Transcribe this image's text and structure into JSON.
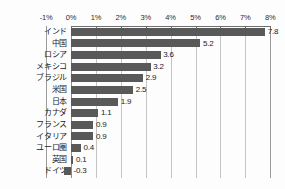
{
  "chart_data": {
    "type": "bar",
    "orientation": "horizontal",
    "title": "",
    "subtitle": "",
    "xlabel": "",
    "ylabel": "",
    "xlim": [
      -1,
      8
    ],
    "x_tick_labels": [
      "-1%",
      "0%",
      "1%",
      "2%",
      "3%",
      "4%",
      "5%",
      "6%",
      "7%",
      "8%"
    ],
    "x_ticks": [
      -1,
      0,
      1,
      2,
      3,
      4,
      5,
      6,
      7,
      8
    ],
    "grid": true,
    "legend": "none",
    "value_suffix": "",
    "categories": [
      "インド",
      "中国",
      "ロシア",
      "メキシコ",
      "ブラジル",
      "米国",
      "日本",
      "カナダ",
      "フランス",
      "イタリア",
      "ユーロ圏",
      "英国",
      "ドイツ"
    ],
    "values": [
      7.8,
      5.2,
      3.6,
      3.2,
      2.9,
      2.5,
      1.9,
      1.1,
      0.9,
      0.9,
      0.4,
      0.1,
      -0.3
    ],
    "data_labels": [
      "7.8",
      "5.2",
      "3.6",
      "3.2",
      "2.9",
      "2.5",
      "1.9",
      "1.1",
      "0.9",
      "0.9",
      "0.4",
      "0.1",
      "-0.3"
    ],
    "colors": {
      "bar": "#595959",
      "gridline": "#c4c4c4",
      "axis": "#8c8c8c",
      "background": "#fdfdfd",
      "text": "#1a1a1a"
    }
  }
}
